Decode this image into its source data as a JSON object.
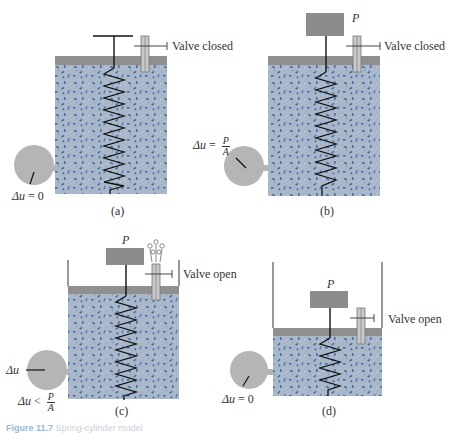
{
  "figure": {
    "caption_prefix": "Figure 11.7",
    "caption_text": "Spring-cylinder model",
    "colors": {
      "fluid": "#a9b8c9",
      "fluid_flecks": "#3d63a8",
      "piston": "#8f8f8f",
      "weight": "#8c8c8c",
      "gauge": "#b5b5b5",
      "spring": "#1a1a1a"
    }
  },
  "panels": [
    {
      "id": "a",
      "label": "(a)",
      "valve_label": "Valve closed",
      "weight_label": "",
      "gauge_label_lhs": "Δu",
      "gauge_label_op": "=",
      "gauge_label_rhs": "0",
      "gauge_reading": "zero"
    },
    {
      "id": "b",
      "label": "(b)",
      "valve_label": "Valve closed",
      "weight_label": "P",
      "gauge_label_lhs": "Δu",
      "gauge_label_op": "=",
      "gauge_label_num": "P",
      "gauge_label_den": "A",
      "gauge_reading": "max"
    },
    {
      "id": "c",
      "label": "(c)",
      "valve_label": "Valve open",
      "weight_label": "P",
      "gauge_label_lhs": "Δu",
      "gauge_label_op": "<",
      "gauge_label_num": "P",
      "gauge_label_den": "A",
      "gauge_label_top": "Δu",
      "gauge_reading": "partial"
    },
    {
      "id": "d",
      "label": "(d)",
      "valve_label": "Valve open",
      "weight_label": "P",
      "gauge_label_lhs": "Δu",
      "gauge_label_op": "=",
      "gauge_label_rhs": "0",
      "gauge_reading": "zero"
    }
  ]
}
